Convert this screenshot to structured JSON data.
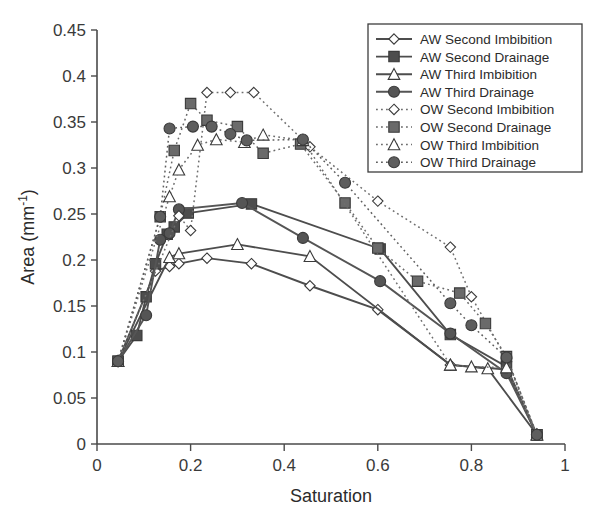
{
  "chart_data": {
    "type": "line",
    "title": "",
    "xlabel": "Saturation",
    "ylabel": "Area (mm-1)",
    "ylabel_display": "Area (mm⁻¹)",
    "xlim": [
      0,
      1
    ],
    "ylim": [
      0,
      0.45
    ],
    "xticks": [
      0,
      0.2,
      0.4,
      0.6,
      0.8,
      1
    ],
    "xtick_labels": [
      "0",
      "0.2",
      "0.4",
      "0.6",
      "0.8",
      "1"
    ],
    "yticks": [
      0,
      0.05,
      0.1,
      0.15,
      0.2,
      0.25,
      0.3,
      0.35,
      0.4,
      0.45
    ],
    "ytick_labels": [
      "0",
      "0.05",
      "0.1",
      "0.15",
      "0.2",
      "0.25",
      "0.3",
      "0.35",
      "0.4",
      "0.45"
    ],
    "grid": false,
    "legend_position": "top-right",
    "series": [
      {
        "name": "AW Second Imbibition",
        "marker": "diamond-open",
        "linestyle": "solid",
        "color": "#4d4d4d",
        "x": [
          0.045,
          0.125,
          0.155,
          0.175,
          0.235,
          0.33,
          0.455,
          0.6,
          0.755,
          0.875,
          0.94
        ],
        "y": [
          0.09,
          0.188,
          0.193,
          0.196,
          0.202,
          0.196,
          0.172,
          0.146,
          0.086,
          0.081,
          0.01
        ]
      },
      {
        "name": "AW Second Drainage",
        "marker": "square-filled",
        "linestyle": "solid",
        "color": "#4d4d4d",
        "x": [
          0.045,
          0.085,
          0.105,
          0.125,
          0.15,
          0.165,
          0.195,
          0.33,
          0.605,
          0.755,
          0.875,
          0.94
        ],
        "y": [
          0.09,
          0.118,
          0.16,
          0.196,
          0.228,
          0.236,
          0.251,
          0.261,
          0.212,
          0.119,
          0.084,
          0.01
        ]
      },
      {
        "name": "AW Third Imbibition",
        "marker": "triangle-open",
        "linestyle": "solid",
        "color": "#4d4d4d",
        "x": [
          0.045,
          0.155,
          0.175,
          0.3,
          0.455,
          0.755,
          0.835,
          0.94
        ],
        "y": [
          0.09,
          0.203,
          0.207,
          0.217,
          0.204,
          0.086,
          0.082,
          0.01
        ]
      },
      {
        "name": "AW Third Drainage",
        "marker": "circle-filled",
        "linestyle": "solid",
        "color": "#555555",
        "x": [
          0.045,
          0.105,
          0.135,
          0.155,
          0.175,
          0.31,
          0.44,
          0.605,
          0.755,
          0.875,
          0.94
        ],
        "y": [
          0.09,
          0.14,
          0.222,
          0.229,
          0.255,
          0.262,
          0.224,
          0.177,
          0.12,
          0.077,
          0.01
        ]
      },
      {
        "name": "OW Second Imbibition",
        "marker": "diamond-open",
        "linestyle": "dotted",
        "color": "#6e6e6e",
        "x": [
          0.045,
          0.175,
          0.2,
          0.235,
          0.285,
          0.335,
          0.455,
          0.6,
          0.755,
          0.8,
          0.875,
          0.94
        ],
        "y": [
          0.09,
          0.248,
          0.232,
          0.382,
          0.382,
          0.382,
          0.323,
          0.264,
          0.214,
          0.16,
          0.093,
          0.01
        ]
      },
      {
        "name": "OW Second Drainage",
        "marker": "square-filled",
        "linestyle": "dotted",
        "color": "#6a6a6a",
        "x": [
          0.045,
          0.135,
          0.165,
          0.2,
          0.235,
          0.3,
          0.355,
          0.435,
          0.53,
          0.6,
          0.685,
          0.775,
          0.83,
          0.875,
          0.94
        ],
        "y": [
          0.09,
          0.247,
          0.319,
          0.37,
          0.352,
          0.345,
          0.316,
          0.326,
          0.262,
          0.213,
          0.177,
          0.164,
          0.131,
          0.095,
          0.01
        ]
      },
      {
        "name": "OW Third Imbibition",
        "marker": "triangle-open",
        "linestyle": "dotted",
        "color": "#6e6e6e",
        "x": [
          0.045,
          0.155,
          0.175,
          0.215,
          0.255,
          0.315,
          0.355,
          0.44,
          0.755,
          0.8,
          0.875,
          0.94
        ],
        "y": [
          0.09,
          0.269,
          0.298,
          0.325,
          0.331,
          0.328,
          0.336,
          0.33,
          0.086,
          0.084,
          0.083,
          0.01
        ]
      },
      {
        "name": "OW Third Drainage",
        "marker": "circle-filled",
        "linestyle": "dotted",
        "color": "#5e5e5e",
        "x": [
          0.045,
          0.135,
          0.155,
          0.205,
          0.245,
          0.285,
          0.32,
          0.44,
          0.53,
          0.755,
          0.8,
          0.875,
          0.94
        ],
        "y": [
          0.09,
          0.247,
          0.343,
          0.345,
          0.345,
          0.337,
          0.33,
          0.331,
          0.284,
          0.153,
          0.129,
          0.094,
          0.01
        ]
      }
    ]
  },
  "legend": {
    "entries": [
      "AW Second Imbibition",
      "AW Second Drainage",
      "AW Third Imbibition",
      "AW Third Drainage",
      "OW Second Imbibition",
      "OW Second Drainage",
      "OW Third Imbibition",
      "OW Third Drainage"
    ]
  },
  "colors": {
    "axis": "#4a4a4a",
    "text": "#2b2b2b",
    "marker_fill": "#6d6d6d",
    "marker_edge": "#3a3a3a",
    "background": "#ffffff"
  }
}
